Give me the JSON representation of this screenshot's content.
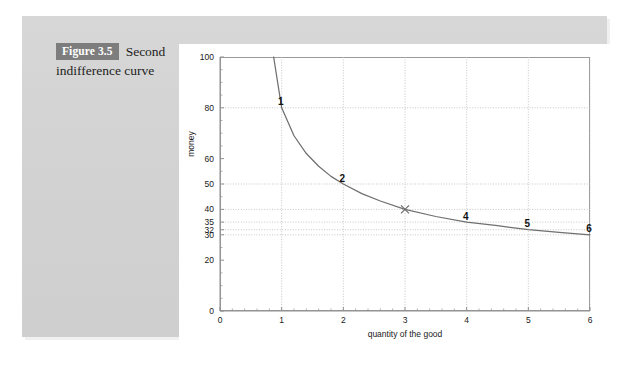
{
  "figure": {
    "badge": "Figure 3.5",
    "caption_first_line": "Second",
    "caption_second_line": "indifference curve",
    "badge_bg": "#7d7d7d",
    "badge_fg": "#ffffff",
    "panel_bg": "#d4d4d4",
    "card_bg": "#ffffff"
  },
  "chart_data": {
    "type": "line",
    "title": "",
    "xlabel": "quantity of the good",
    "ylabel": "money",
    "xlim": [
      0,
      6
    ],
    "ylim": [
      0,
      100
    ],
    "grid": true,
    "legend": "none",
    "x_ticks": [
      0,
      1,
      2,
      3,
      4,
      5,
      6
    ],
    "x_tick_labels": [
      "0",
      "1",
      "2",
      "3",
      "4",
      "5",
      "6"
    ],
    "y_ticks": [
      0,
      20,
      30,
      32,
      35,
      40,
      50,
      60,
      80,
      100
    ],
    "y_tick_labels": [
      "0",
      "20",
      "30",
      "32",
      "35",
      "40",
      "50",
      "60",
      "80",
      "100"
    ],
    "x_minor_ticks": [
      0.2,
      0.4,
      0.6,
      0.8,
      1.2,
      1.4,
      1.6,
      1.8,
      2.2,
      2.4,
      2.6,
      2.8,
      3.2,
      3.4,
      3.6,
      3.8,
      4.2,
      4.4,
      4.6,
      4.8,
      5.2,
      5.4,
      5.6,
      5.8
    ],
    "y_minor_ticks": [
      5,
      10,
      15,
      25,
      45,
      55,
      65,
      70,
      75,
      85,
      90,
      95
    ],
    "series": [
      {
        "name": "indifference curve",
        "color": "#6f6f6f",
        "x": [
          0.87,
          1.0,
          1.2,
          1.4,
          1.6,
          1.8,
          2.0,
          2.3,
          2.6,
          3.0,
          3.5,
          4.0,
          4.5,
          5.0,
          5.5,
          6.0
        ],
        "y": [
          100,
          80,
          69,
          62,
          57,
          53,
          50,
          46.2,
          43.3,
          40,
          37.2,
          35,
          33.6,
          32,
          31,
          30
        ]
      }
    ],
    "points": [
      {
        "label": "1",
        "x": 1,
        "y": 80,
        "marker": "none"
      },
      {
        "label": "2",
        "x": 2,
        "y": 50,
        "marker": "none"
      },
      {
        "label": "",
        "x": 3,
        "y": 40,
        "marker": "x"
      },
      {
        "label": "4",
        "x": 4,
        "y": 35,
        "marker": "none"
      },
      {
        "label": "5",
        "x": 5,
        "y": 32,
        "marker": "none"
      },
      {
        "label": "6",
        "x": 6,
        "y": 30,
        "marker": "none"
      }
    ],
    "highlight_gridlines": [
      {
        "axis": "y",
        "value": 80
      },
      {
        "axis": "y",
        "value": 50
      },
      {
        "axis": "y",
        "value": 40
      },
      {
        "axis": "y",
        "value": 35
      },
      {
        "axis": "y",
        "value": 32
      },
      {
        "axis": "y",
        "value": 30
      },
      {
        "axis": "x",
        "value": 1
      },
      {
        "axis": "x",
        "value": 2
      },
      {
        "axis": "x",
        "value": 3
      },
      {
        "axis": "x",
        "value": 4
      },
      {
        "axis": "x",
        "value": 5
      },
      {
        "axis": "x",
        "value": 6
      }
    ],
    "colors": {
      "curve": "#6f6f6f",
      "grid": "#b9b9b9",
      "axis": "#8f8f8f",
      "text": "#1a1a1a",
      "marker": "#6f6f6f"
    }
  }
}
